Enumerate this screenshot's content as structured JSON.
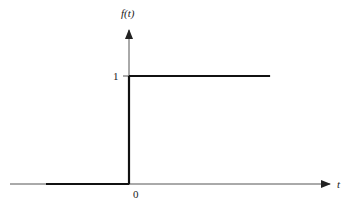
{
  "chart_data": {
    "type": "line",
    "title": "",
    "function_label": "f(t)",
    "xlabel": "t",
    "ylabel": "f(t)",
    "x_tick_labels": [
      "0"
    ],
    "y_tick_labels": [
      "1"
    ],
    "segments": [
      {
        "name": "zero-part",
        "x": [
          -1,
          0
        ],
        "y": [
          0,
          0
        ]
      },
      {
        "name": "jump",
        "x": [
          0,
          0
        ],
        "y": [
          0,
          1
        ]
      },
      {
        "name": "one-part",
        "x": [
          0,
          1.7
        ],
        "y": [
          1,
          1
        ]
      }
    ],
    "grid": false,
    "legend": "none"
  },
  "labels": {
    "y_axis": "f(t)",
    "x_axis": "t",
    "origin": "0",
    "one": "1"
  },
  "colors": {
    "line": "#111111",
    "axis": "#444444"
  }
}
